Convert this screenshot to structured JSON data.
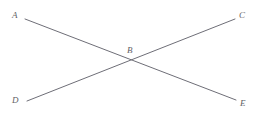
{
  "figure": {
    "name": "two-intersecting-line-segments",
    "background_color": "#ffffff",
    "width": 258,
    "height": 114,
    "stroke_color": "#6e6e77",
    "stroke_width": 1,
    "label_color": "#5f5f66"
  },
  "labels": {
    "a": "A",
    "b": "B",
    "c": "C",
    "d": "D",
    "e": "E"
  },
  "chart_data": {
    "type": "scatter",
    "title": "",
    "xlabel": "",
    "ylabel": "",
    "grid": false,
    "legend": null,
    "points": [
      {
        "name": "A",
        "label": "A",
        "x": 25,
        "y": 19
      },
      {
        "name": "C",
        "label": "C",
        "x": 235,
        "y": 19
      },
      {
        "name": "B",
        "label": "B",
        "x": 132,
        "y": 59
      },
      {
        "name": "D",
        "label": "D",
        "x": 27,
        "y": 101
      },
      {
        "name": "E",
        "label": "E",
        "x": 236,
        "y": 100
      }
    ],
    "segments": [
      {
        "name": "segment-AE",
        "from": "A",
        "to": "E",
        "x1": 25,
        "y1": 19,
        "x2": 236,
        "y2": 100
      },
      {
        "name": "segment-DC",
        "from": "D",
        "to": "C",
        "x1": 27,
        "y1": 101,
        "x2": 235,
        "y2": 19
      }
    ],
    "intersections": [
      {
        "name": "B",
        "label": "B",
        "x": 132,
        "y": 59,
        "of": [
          "segment-AE",
          "segment-DC"
        ]
      }
    ]
  }
}
